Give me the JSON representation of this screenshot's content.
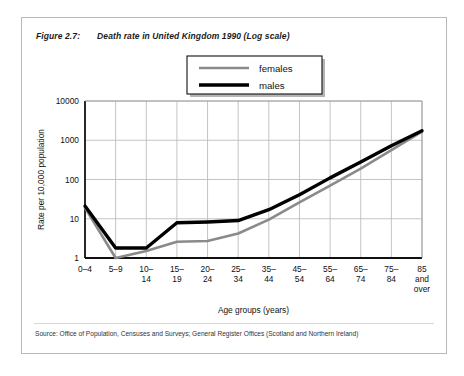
{
  "figure": {
    "label": "Figure 2.7:",
    "title": "Death rate in United Kingdom 1990 (Log scale)"
  },
  "source": {
    "note": "Source: Office of Population, Censuses and Surveys; General Register Offices (Scotland and Northern Ireland)"
  },
  "legend": {
    "position": "top-center",
    "items": [
      {
        "name": "females",
        "color": "#8a8a8a"
      },
      {
        "name": "males",
        "color": "#000000"
      }
    ]
  },
  "chart_data": {
    "type": "line",
    "title": "Death rate in United Kingdom 1990 (Log scale)",
    "xlabel": "Age groups (years)",
    "ylabel": "Rate per 10,000  population",
    "yscale": "log",
    "ylim": [
      1,
      10000
    ],
    "ytick_labels": [
      "1",
      "10",
      "100",
      "1000",
      "10000"
    ],
    "ytick_values": [
      1,
      10,
      100,
      1000,
      10000
    ],
    "grid": true,
    "categories": [
      "0–4",
      "5–9",
      "10–14",
      "15–19",
      "20–24",
      "25–34",
      "35–44",
      "45–54",
      "55–64",
      "65–74",
      "75–84",
      "85 and over"
    ],
    "category_lines": [
      [
        "0–4"
      ],
      [
        "5–9"
      ],
      [
        "10–",
        "14"
      ],
      [
        "15–",
        "19"
      ],
      [
        "20–",
        "24"
      ],
      [
        "25–",
        "34"
      ],
      [
        "35–",
        "44"
      ],
      [
        "45–",
        "54"
      ],
      [
        "55–",
        "64"
      ],
      [
        "65–",
        "74"
      ],
      [
        "75–",
        "84"
      ],
      [
        "85",
        "and",
        "over"
      ]
    ],
    "series": [
      {
        "name": "females",
        "color": "#8a8a8a",
        "width": 2.6,
        "values": [
          19,
          1.0,
          1.5,
          2.6,
          2.7,
          4.2,
          9.5,
          26,
          70,
          190,
          560,
          1650
        ]
      },
      {
        "name": "males",
        "color": "#000000",
        "width": 3.4,
        "values": [
          21,
          1.8,
          1.8,
          7.9,
          8.3,
          9.0,
          17,
          41,
          110,
          280,
          720,
          1750
        ]
      }
    ]
  }
}
